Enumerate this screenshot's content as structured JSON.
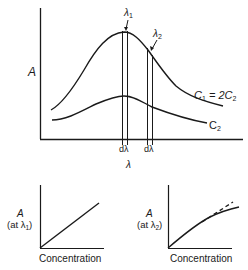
{
  "main_plot": {
    "y_axis_label": "A",
    "x_axis_label": "λ",
    "markers": [
      {
        "label": "λ",
        "subscript": "1"
      },
      {
        "label": "λ",
        "subscript": "2"
      }
    ],
    "bandwidth_labels": [
      "dλ",
      "dλ"
    ],
    "curves": [
      {
        "label_main": "C",
        "label_sub": "1",
        "label_eq": " = 2C",
        "label_eq_sub": "2"
      },
      {
        "label_main": "C",
        "label_sub": "2"
      }
    ]
  },
  "inset_left": {
    "y_label_line1": "A",
    "y_label_line2_prefix": "(at λ",
    "y_label_line2_sub": "1",
    "y_label_line2_suffix": ")",
    "x_label": "Concentration"
  },
  "inset_right": {
    "y_label_line1": "A",
    "y_label_line2_prefix": "(at λ",
    "y_label_line2_sub": "2",
    "y_label_line2_suffix": ")",
    "x_label": "Concentration"
  },
  "colors": {
    "ink": "#1a1a1a",
    "background": "#ffffff"
  }
}
